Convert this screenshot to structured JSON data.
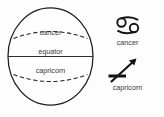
{
  "figure": {
    "background_color": "#fdfdfd",
    "line_color": "#1d1d1d",
    "text_color": "#3a3a3a"
  },
  "globe": {
    "name": "sphere",
    "labels": {
      "cancer": "cancer",
      "equator": "equator",
      "capricorn": "capricorn"
    },
    "lines": {
      "tropic_of_cancer_style": "dashed",
      "equator_style": "solid",
      "tropic_of_capricorn_style": "dashed",
      "outline_style": "solid"
    }
  },
  "legend": {
    "items": [
      {
        "glyph_name": "cancer-zodiac-glyph",
        "symbol": "♋",
        "label": "cancer"
      },
      {
        "glyph_name": "capricorn-zodiac-glyph",
        "symbol": "♐",
        "label": "capricorn"
      }
    ]
  }
}
